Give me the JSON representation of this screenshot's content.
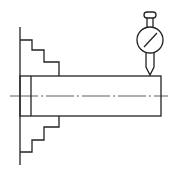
{
  "diagram": {
    "elements": [
      "chuck-face",
      "upper-jaw",
      "lower-jaw",
      "workpiece-shaft",
      "centerline",
      "dial-indicator"
    ],
    "colors": {
      "stroke": "#222222",
      "background": "#ffffff"
    }
  }
}
